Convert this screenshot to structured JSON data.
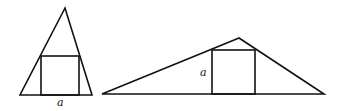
{
  "figures": [
    {
      "name": "tall-triangle",
      "triangle": [
        [
          65,
          8
        ],
        [
          20,
          95
        ],
        [
          92,
          95
        ]
      ],
      "square": {
        "x": 41,
        "y": 56,
        "w": 38,
        "h": 39
      },
      "label": {
        "text": "a",
        "x": 57,
        "y": 106
      }
    },
    {
      "name": "wide-triangle",
      "triangle": [
        [
          239,
          38
        ],
        [
          102,
          94
        ],
        [
          324,
          94
        ]
      ],
      "square": {
        "x": 212,
        "y": 50,
        "w": 43,
        "h": 44
      },
      "label": {
        "text": "a",
        "x": 200,
        "y": 76
      }
    }
  ],
  "colors": {
    "stroke": "#111111",
    "background": "#ffffff"
  }
}
